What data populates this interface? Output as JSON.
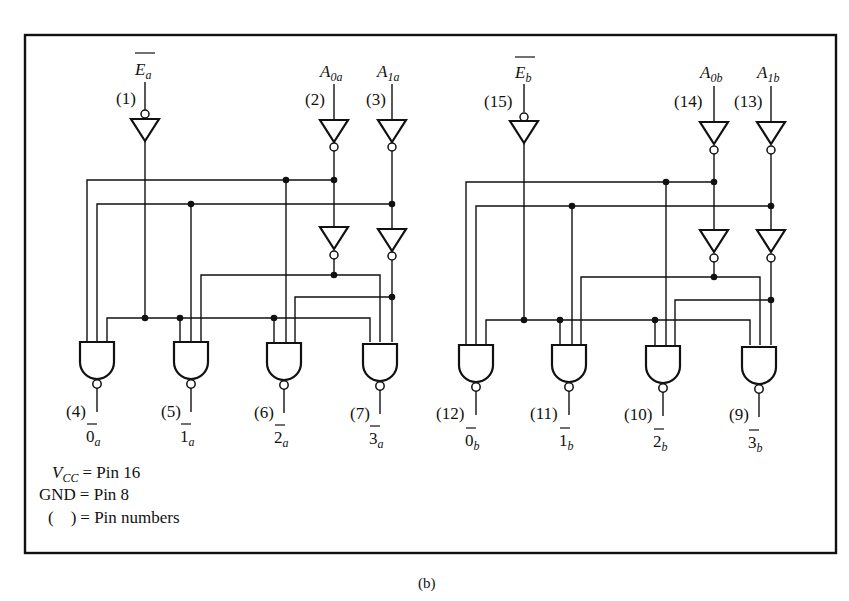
{
  "figure": {
    "caption": "(b)",
    "colors": {
      "line": "#111111",
      "background": "#ffffff"
    }
  },
  "section_a": {
    "enable": {
      "name": "E",
      "sub": "a",
      "pin": "(1)"
    },
    "A0": {
      "name": "A",
      "sub": "0a",
      "pin": "(2)"
    },
    "A1": {
      "name": "A",
      "sub": "1a",
      "pin": "(3)"
    },
    "outputs": [
      {
        "pin": "(4)",
        "digit": "0",
        "sub": "a"
      },
      {
        "pin": "(5)",
        "digit": "1",
        "sub": "a"
      },
      {
        "pin": "(6)",
        "digit": "2",
        "sub": "a"
      },
      {
        "pin": "(7)",
        "digit": "3",
        "sub": "a"
      }
    ]
  },
  "section_b": {
    "enable": {
      "name": "E",
      "sub": "b",
      "pin": "(15)"
    },
    "A0": {
      "name": "A",
      "sub": "0b",
      "pin": "(14)"
    },
    "A1": {
      "name": "A",
      "sub": "1b",
      "pin": "(13)"
    },
    "outputs": [
      {
        "pin": "(12)",
        "digit": "0",
        "sub": "b"
      },
      {
        "pin": "(11)",
        "digit": "1",
        "sub": "b"
      },
      {
        "pin": "(10)",
        "digit": "2",
        "sub": "b"
      },
      {
        "pin": "(9)",
        "digit": "3",
        "sub": "b"
      }
    ]
  },
  "legend": {
    "vcc": {
      "name": "V",
      "sub": "CC",
      "value": "= Pin 16"
    },
    "gnd": {
      "name": "GND",
      "value": "= Pin 8"
    },
    "pins": {
      "name": "(    )",
      "value": "= Pin numbers"
    }
  }
}
